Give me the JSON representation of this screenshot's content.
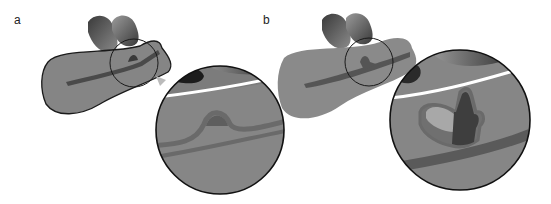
{
  "figure": {
    "panels": [
      {
        "label": "a",
        "description": "Organ cross-section with duct and small bulge; magnified inset circle"
      },
      {
        "label": "b",
        "description": "Organ cross-section with duct and branching outgrowth; magnified inset circle"
      }
    ]
  },
  "colors": {
    "tissue": "#858585",
    "tissue_dark": "#5a5a5a",
    "duct": "#4a4a4a",
    "outline": "#1a1a1a",
    "lobe_light": "#9a9a9a",
    "lobe_dark": "#2e2e2e",
    "background": "#ffffff"
  }
}
